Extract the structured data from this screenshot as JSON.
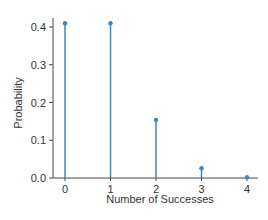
{
  "chart_data": {
    "type": "stem",
    "title": "",
    "xlabel": "Number of Successes",
    "ylabel": "Probability",
    "categories": [
      "0",
      "1",
      "2",
      "3",
      "4"
    ],
    "x": [
      0,
      1,
      2,
      3,
      4
    ],
    "values": [
      0.41,
      0.41,
      0.154,
      0.026,
      0.002
    ],
    "yticks": [
      "0.0",
      "0.1",
      "0.2",
      "0.3",
      "0.4"
    ],
    "ylim": [
      0,
      0.42
    ],
    "grid": false,
    "legend": null,
    "color": "#3b86c6"
  }
}
